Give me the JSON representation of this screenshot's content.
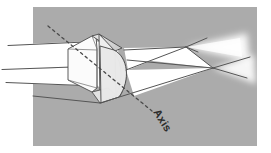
{
  "figure": {
    "kind": "optics-ray-diagram",
    "background_color": "#ffffff",
    "panel_color": "#ababab",
    "panel": {
      "x": 33,
      "y": 7,
      "width": 224,
      "height": 139
    }
  },
  "labels": {
    "axis": "Axis"
  },
  "colors": {
    "panel_gray": "#ababab",
    "beam_white": "#ffffff",
    "lens_body": "#f2f2f2",
    "lens_top_face": "#d8d8d8",
    "lens_curved_face": "#e4e4e4",
    "ray_stroke": "#555555",
    "outline_stroke": "#4a4a4a",
    "dashed_axis": "#4a4a4a",
    "label_text": "#2b2b2b",
    "glow_white": "#ffffff"
  },
  "geometry": {
    "incoming_rays": [
      {
        "name": "upper-ray",
        "x1": 8,
        "y1": 45,
        "x2": 88,
        "y2": 42
      },
      {
        "name": "middle-ray",
        "x1": 2,
        "y1": 69,
        "x2": 86,
        "y2": 66
      },
      {
        "name": "lower-ray",
        "x1": 6,
        "y1": 82,
        "x2": 92,
        "y2": 79
      }
    ],
    "outgoing_rays": [
      {
        "name": "exit-ray-upper-to-focus-a",
        "x1": 128,
        "y1": 52,
        "x2": 186,
        "y2": 47
      },
      {
        "name": "exit-ray-lower-to-focus-a",
        "x1": 126,
        "y1": 68,
        "x2": 186,
        "y2": 47
      },
      {
        "name": "exit-ray-upper-to-focus-b",
        "x1": 186,
        "y1": 47,
        "x2": 213,
        "y2": 68
      },
      {
        "name": "exit-ray-spread-a",
        "x1": 186,
        "y1": 47,
        "x2": 200,
        "y2": 41
      },
      {
        "name": "exit-ray-spread-b",
        "x1": 213,
        "y1": 68,
        "x2": 248,
        "y2": 60
      },
      {
        "name": "exit-ray-spread-c",
        "x1": 213,
        "y1": 68,
        "x2": 245,
        "y2": 76
      }
    ],
    "focal_points": [
      {
        "name": "focus-point-a",
        "x": 186,
        "y": 47
      },
      {
        "name": "focus-point-b",
        "x": 213,
        "y": 68
      }
    ],
    "axis_dashed_line": {
      "x1": 48,
      "y1": 26,
      "x2": 152,
      "y2": 111
    },
    "axis_label_position": {
      "x": 152,
      "y": 112,
      "rotation_deg": 58
    }
  }
}
